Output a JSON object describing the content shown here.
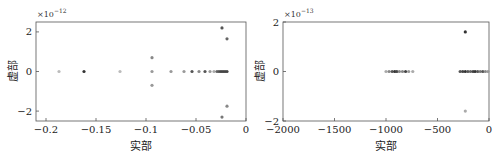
{
  "chart_data": [
    {
      "type": "scatter",
      "title": "",
      "xlabel": "实部",
      "ylabel": "虚部",
      "y_multiplier": "×10^-12",
      "y_multiplier_base": "×10",
      "y_multiplier_exp": "−12",
      "xlim": [
        -0.21,
        0
      ],
      "ylim": [
        -2.5,
        2.5
      ],
      "xticks": [
        -0.2,
        -0.15,
        -0.1,
        -0.05,
        0
      ],
      "xtick_labels": [
        "−0.2",
        "−0.15",
        "−0.1",
        "−0.05",
        "0"
      ],
      "yticks": [
        -2,
        0,
        2
      ],
      "ytick_labels": [
        "−2",
        "0",
        "2"
      ],
      "grid": false,
      "points": [
        {
          "x": -0.187,
          "y": 0,
          "shade": "#bbbbbb"
        },
        {
          "x": -0.162,
          "y": 0,
          "shade": "#333333"
        },
        {
          "x": -0.126,
          "y": 0,
          "shade": "#bbbbbb"
        },
        {
          "x": -0.094,
          "y": 0.7,
          "shade": "#888888"
        },
        {
          "x": -0.094,
          "y": 0,
          "shade": "#999999"
        },
        {
          "x": -0.094,
          "y": -0.7,
          "shade": "#999999"
        },
        {
          "x": -0.075,
          "y": 0,
          "shade": "#999999"
        },
        {
          "x": -0.062,
          "y": 0,
          "shade": "#999999"
        },
        {
          "x": -0.054,
          "y": 0,
          "shade": "#555555"
        },
        {
          "x": -0.047,
          "y": 0,
          "shade": "#888888"
        },
        {
          "x": -0.041,
          "y": 0,
          "shade": "#555555"
        },
        {
          "x": -0.036,
          "y": 0,
          "shade": "#999999"
        },
        {
          "x": -0.032,
          "y": 0,
          "shade": "#aaaaaa"
        },
        {
          "x": -0.029,
          "y": 0,
          "shade": "#666666"
        },
        {
          "x": -0.027,
          "y": 0,
          "shade": "#555555"
        },
        {
          "x": -0.025,
          "y": 0,
          "shade": "#444444"
        },
        {
          "x": -0.023,
          "y": 0,
          "shade": "#444444"
        },
        {
          "x": -0.021,
          "y": 0,
          "shade": "#444444"
        },
        {
          "x": -0.019,
          "y": 0,
          "shade": "#444444"
        },
        {
          "x": -0.024,
          "y": 2.2,
          "shade": "#555555"
        },
        {
          "x": -0.019,
          "y": 1.65,
          "shade": "#666666"
        },
        {
          "x": -0.019,
          "y": -1.75,
          "shade": "#888888"
        },
        {
          "x": -0.024,
          "y": -2.3,
          "shade": "#777777"
        }
      ]
    },
    {
      "type": "scatter",
      "title": "",
      "xlabel": "实部",
      "ylabel": "虚部",
      "y_multiplier": "×10^-13",
      "y_multiplier_base": "×10",
      "y_multiplier_exp": "−13",
      "xlim": [
        -2000,
        0
      ],
      "ylim": [
        -2,
        2
      ],
      "xticks": [
        -2000,
        -1500,
        -1000,
        -500,
        0
      ],
      "xtick_labels": [
        "−2000",
        "−1500",
        "−1000",
        "−500",
        "0"
      ],
      "yticks": [
        -2,
        0,
        2
      ],
      "ytick_labels": [
        "−2",
        "0",
        "2"
      ],
      "grid": false,
      "points": [
        {
          "x": -1000,
          "y": 0,
          "shade": "#aaaaaa"
        },
        {
          "x": -970,
          "y": 0,
          "shade": "#888888"
        },
        {
          "x": -940,
          "y": 0,
          "shade": "#555555"
        },
        {
          "x": -915,
          "y": 0,
          "shade": "#333333"
        },
        {
          "x": -895,
          "y": 0,
          "shade": "#444444"
        },
        {
          "x": -870,
          "y": 0,
          "shade": "#888888"
        },
        {
          "x": -840,
          "y": 0,
          "shade": "#888888"
        },
        {
          "x": -810,
          "y": 0,
          "shade": "#444444"
        },
        {
          "x": -780,
          "y": 0,
          "shade": "#999999"
        },
        {
          "x": -740,
          "y": 0,
          "shade": "#aaaaaa"
        },
        {
          "x": -280,
          "y": 0,
          "shade": "#555555"
        },
        {
          "x": -255,
          "y": 0,
          "shade": "#444444"
        },
        {
          "x": -230,
          "y": 0,
          "shade": "#333333"
        },
        {
          "x": -205,
          "y": 0,
          "shade": "#555555"
        },
        {
          "x": -180,
          "y": 0,
          "shade": "#666666"
        },
        {
          "x": -155,
          "y": 0,
          "shade": "#444444"
        },
        {
          "x": -135,
          "y": 0,
          "shade": "#333333"
        },
        {
          "x": -110,
          "y": 0,
          "shade": "#555555"
        },
        {
          "x": -85,
          "y": 0,
          "shade": "#777777"
        },
        {
          "x": -60,
          "y": 0,
          "shade": "#555555"
        },
        {
          "x": -35,
          "y": 0,
          "shade": "#888888"
        },
        {
          "x": -10,
          "y": 0,
          "shade": "#999999"
        },
        {
          "x": -230,
          "y": 1.6,
          "shade": "#333333"
        },
        {
          "x": -230,
          "y": -1.6,
          "shade": "#aaaaaa"
        }
      ]
    }
  ]
}
